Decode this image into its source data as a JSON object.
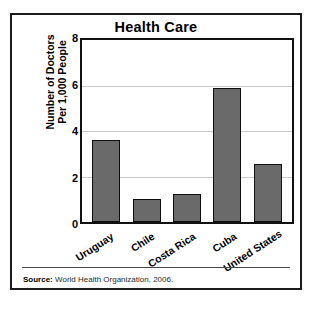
{
  "chart_data": {
    "type": "bar",
    "title": "Health Care",
    "xlabel": "",
    "ylabel": "Number of Doctors\nPer 1,000 People",
    "categories": [
      "Uruguay",
      "Chile",
      "Costa Rica",
      "Cuba",
      "United States"
    ],
    "values": [
      3.6,
      1.0,
      1.25,
      5.9,
      2.55
    ],
    "ylim": [
      0,
      8
    ],
    "yticks": [
      0,
      2,
      4,
      6,
      8
    ],
    "ytick_labels": [
      "0",
      "2",
      "4",
      "6",
      "8"
    ],
    "grid": true,
    "legend": false,
    "bar_color": "#6a6a6a",
    "bar_edge_color": "#0f0f0f"
  },
  "footer": {
    "source_label": "Source:",
    "source_text": " World Health Organization, 2006."
  }
}
